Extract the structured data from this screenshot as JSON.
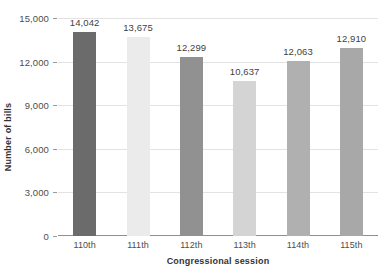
{
  "chart_data": {
    "type": "bar",
    "title": "",
    "subtitle": "",
    "xlabel": "Congressional session",
    "ylabel": "Number of bills",
    "categories": [
      "110th",
      "111th",
      "112th",
      "113th",
      "114th",
      "115th"
    ],
    "values": [
      14042,
      13675,
      12299,
      10637,
      12063,
      12910
    ],
    "value_labels": [
      "14,042",
      "13,675",
      "12,299",
      "10,637",
      "12,063",
      "12,910"
    ],
    "bar_colors": [
      "#6b6b6b",
      "#ebebeb",
      "#919191",
      "#d4d4d4",
      "#b0b0b0",
      "#a8a8a8"
    ],
    "ylim": [
      0,
      15000
    ],
    "ytick_values": [
      0,
      3000,
      6000,
      9000,
      12000,
      15000
    ],
    "ytick_labels": [
      "0",
      "3,000",
      "6,000",
      "9,000",
      "12,000",
      "15,000"
    ],
    "grid": true,
    "grid_color": "#e3e3e3",
    "legend": null,
    "legend_position": "none",
    "background": "#ffffff",
    "axis_color": "#8f8f8f",
    "text_color": "#4d4d4d",
    "label_text_color": "#333333"
  }
}
